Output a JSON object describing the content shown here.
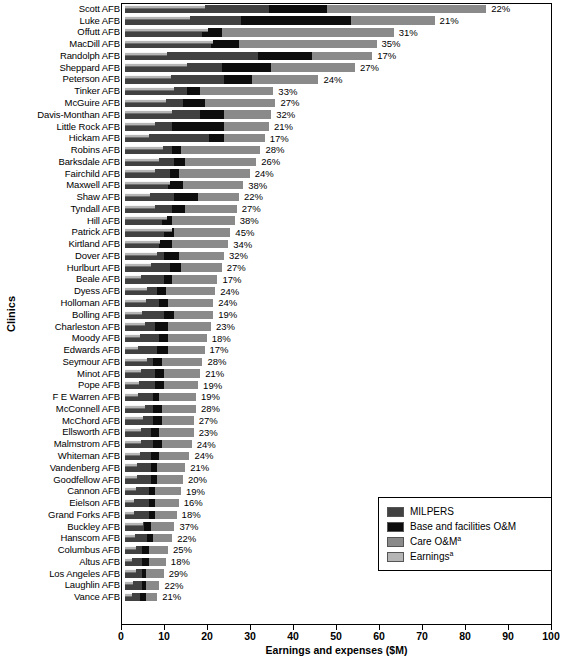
{
  "chart_data": {
    "type": "bar",
    "orientation": "horizontal",
    "stacked": true,
    "title": "",
    "xlabel": "Earnings and expenses ($M)",
    "ylabel": "Clinics",
    "xlim": [
      0,
      100
    ],
    "xticks": [
      0,
      10,
      20,
      30,
      40,
      50,
      60,
      70,
      80,
      90,
      100
    ],
    "grid": false,
    "legend_position": "lower-right",
    "legend": [
      {
        "name": "MILPERS",
        "color": "#414141"
      },
      {
        "name": "Base and facilities O&M",
        "color": "#0d0d0d"
      },
      {
        "name": "Care O&M",
        "superscript": "a",
        "color": "#8a8a8a"
      },
      {
        "name": "Earnings",
        "superscript": "a",
        "color": "#b5b5b5"
      }
    ],
    "series": [
      {
        "name": "MILPERS",
        "key": "milpers"
      },
      {
        "name": "Base and facilities O&M",
        "key": "bfom"
      },
      {
        "name": "Care O&M",
        "key": "care"
      },
      {
        "name": "Earnings",
        "key": "earnings"
      }
    ],
    "categories": [
      "Scott AFB",
      "Luke AFB",
      "Offutt AFB",
      "MacDill AFB",
      "Randolph AFB",
      "Sheppard AFB",
      "Peterson AFB",
      "Tinker AFB",
      "McGuire AFB",
      "Davis-Monthan AFB",
      "Little Rock AFB",
      "Hickam AFB",
      "Robins AFB",
      "Barksdale AFB",
      "Fairchild AFB",
      "Maxwell AFB",
      "Shaw AFB",
      "Tyndall AFB",
      "Hill AFB",
      "Patrick AFB",
      "Kirtland AFB",
      "Dover AFB",
      "Hurlburt AFB",
      "Beale AFB",
      "Dyess AFB",
      "Holloman AFB",
      "Bolling AFB",
      "Charleston AFB",
      "Moody AFB",
      "Edwards AFB",
      "Seymour AFB",
      "Minot AFB",
      "Pope AFB",
      "F E Warren AFB",
      "McConnell AFB",
      "McChord AFB",
      "Ellsworth AFB",
      "Malmstrom AFB",
      "Whiteman AFB",
      "Vandenberg AFB",
      "Goodfellow AFB",
      "Cannon AFB",
      "Eielson AFB",
      "Grand Forks AFB",
      "Buckley AFB",
      "Hanscom AFB",
      "Columbus AFB",
      "Altus AFB",
      "Los Angeles AFB",
      "Laughlin AFB",
      "Vance AFB"
    ],
    "rows": [
      {
        "clinic": "Scott AFB",
        "milpers": 33.5,
        "bfom": 13.5,
        "care": 37.0,
        "total": 84.0,
        "earnings": 18.5,
        "pct": "22%"
      },
      {
        "clinic": "Luke AFB",
        "milpers": 27.0,
        "bfom": 25.5,
        "care": 19.5,
        "total": 72.0,
        "earnings": 15.1,
        "pct": "21%"
      },
      {
        "clinic": "Offutt AFB",
        "milpers": 18.0,
        "bfom": 4.5,
        "care": 40.0,
        "total": 62.5,
        "earnings": 19.4,
        "pct": "31%"
      },
      {
        "clinic": "MacDill AFB",
        "milpers": 20.0,
        "bfom": 6.5,
        "care": 32.0,
        "total": 58.5,
        "earnings": 20.5,
        "pct": "35%"
      },
      {
        "clinic": "Randolph AFB",
        "milpers": 31.0,
        "bfom": 12.5,
        "care": 14.0,
        "total": 57.5,
        "earnings": 9.8,
        "pct": "17%"
      },
      {
        "clinic": "Sheppard AFB",
        "milpers": 22.5,
        "bfom": 11.5,
        "care": 19.5,
        "total": 53.5,
        "earnings": 14.4,
        "pct": "27%"
      },
      {
        "clinic": "Peterson AFB",
        "milpers": 23.0,
        "bfom": 6.5,
        "care": 15.5,
        "total": 45.0,
        "earnings": 10.8,
        "pct": "24%"
      },
      {
        "clinic": "Tinker AFB",
        "milpers": 14.5,
        "bfom": 3.0,
        "care": 17.0,
        "total": 34.5,
        "earnings": 11.4,
        "pct": "33%"
      },
      {
        "clinic": "McGuire AFB",
        "milpers": 13.5,
        "bfom": 5.0,
        "care": 16.5,
        "total": 35.0,
        "earnings": 9.5,
        "pct": "27%"
      },
      {
        "clinic": "Davis-Monthan AFB",
        "milpers": 17.5,
        "bfom": 5.5,
        "care": 11.0,
        "total": 34.0,
        "earnings": 10.9,
        "pct": "32%"
      },
      {
        "clinic": "Little Rock AFB",
        "milpers": 11.0,
        "bfom": 12.0,
        "care": 10.5,
        "total": 33.5,
        "earnings": 7.0,
        "pct": "21%"
      },
      {
        "clinic": "Hickam AFB",
        "milpers": 19.5,
        "bfom": 3.5,
        "care": 9.5,
        "total": 32.5,
        "earnings": 5.5,
        "pct": "17%"
      },
      {
        "clinic": "Robins AFB",
        "milpers": 11.0,
        "bfom": 2.0,
        "care": 18.5,
        "total": 31.5,
        "earnings": 8.8,
        "pct": "28%"
      },
      {
        "clinic": "Barksdale AFB",
        "milpers": 11.5,
        "bfom": 2.5,
        "care": 16.5,
        "total": 30.5,
        "earnings": 7.9,
        "pct": "26%"
      },
      {
        "clinic": "Fairchild AFB",
        "milpers": 10.5,
        "bfom": 2.0,
        "care": 16.5,
        "total": 29.0,
        "earnings": 7.0,
        "pct": "24%"
      },
      {
        "clinic": "Maxwell AFB",
        "milpers": 10.0,
        "bfom": 3.5,
        "care": 14.0,
        "total": 27.5,
        "earnings": 10.5,
        "pct": "38%"
      },
      {
        "clinic": "Shaw AFB",
        "milpers": 11.5,
        "bfom": 5.5,
        "care": 9.5,
        "total": 26.5,
        "earnings": 5.8,
        "pct": "22%"
      },
      {
        "clinic": "Tyndall AFB",
        "milpers": 11.0,
        "bfom": 3.0,
        "care": 12.0,
        "total": 26.0,
        "earnings": 7.0,
        "pct": "27%"
      },
      {
        "clinic": "Hill AFB",
        "milpers": 8.5,
        "bfom": 2.5,
        "care": 14.5,
        "total": 25.5,
        "earnings": 9.7,
        "pct": "38%"
      },
      {
        "clinic": "Patrick AFB",
        "milpers": 9.0,
        "bfom": 2.5,
        "care": 13.0,
        "total": 24.5,
        "earnings": 11.0,
        "pct": "45%"
      },
      {
        "clinic": "Kirtland AFB",
        "milpers": 8.0,
        "bfom": 3.0,
        "care": 13.0,
        "total": 24.0,
        "earnings": 8.2,
        "pct": "34%"
      },
      {
        "clinic": "Dover AFB",
        "milpers": 9.0,
        "bfom": 3.5,
        "care": 10.5,
        "total": 23.0,
        "earnings": 7.4,
        "pct": "32%"
      },
      {
        "clinic": "Hurlburt AFB",
        "milpers": 10.5,
        "bfom": 2.5,
        "care": 9.5,
        "total": 22.5,
        "earnings": 6.1,
        "pct": "27%"
      },
      {
        "clinic": "Beale AFB",
        "milpers": 9.0,
        "bfom": 2.0,
        "care": 10.5,
        "total": 21.5,
        "earnings": 3.7,
        "pct": "17%"
      },
      {
        "clinic": "Dyess AFB",
        "milpers": 7.5,
        "bfom": 2.0,
        "care": 11.5,
        "total": 21.0,
        "earnings": 5.0,
        "pct": "24%"
      },
      {
        "clinic": "Holloman AFB",
        "milpers": 8.0,
        "bfom": 2.0,
        "care": 10.5,
        "total": 20.5,
        "earnings": 4.9,
        "pct": "24%"
      },
      {
        "clinic": "Bolling AFB",
        "milpers": 9.0,
        "bfom": 2.5,
        "care": 9.0,
        "total": 20.5,
        "earnings": 3.9,
        "pct": "19%"
      },
      {
        "clinic": "Charleston AFB",
        "milpers": 7.0,
        "bfom": 3.0,
        "care": 10.0,
        "total": 20.0,
        "earnings": 4.6,
        "pct": "23%"
      },
      {
        "clinic": "Moody AFB",
        "milpers": 8.0,
        "bfom": 2.0,
        "care": 9.0,
        "total": 19.0,
        "earnings": 3.4,
        "pct": "18%"
      },
      {
        "clinic": "Edwards AFB",
        "milpers": 7.5,
        "bfom": 2.5,
        "care": 8.5,
        "total": 18.5,
        "earnings": 3.1,
        "pct": "17%"
      },
      {
        "clinic": "Seymour AFB",
        "milpers": 6.5,
        "bfom": 2.0,
        "care": 9.5,
        "total": 18.0,
        "earnings": 5.0,
        "pct": "28%"
      },
      {
        "clinic": "Minot AFB",
        "milpers": 7.0,
        "bfom": 2.0,
        "care": 8.5,
        "total": 17.5,
        "earnings": 3.7,
        "pct": "21%"
      },
      {
        "clinic": "Pope AFB",
        "milpers": 7.0,
        "bfom": 2.0,
        "care": 8.0,
        "total": 17.0,
        "earnings": 3.2,
        "pct": "19%"
      },
      {
        "clinic": "F E Warren AFB",
        "milpers": 6.5,
        "bfom": 1.5,
        "care": 8.5,
        "total": 16.5,
        "earnings": 3.1,
        "pct": "19%"
      },
      {
        "clinic": "McConnell AFB",
        "milpers": 6.5,
        "bfom": 2.0,
        "care": 8.0,
        "total": 16.5,
        "earnings": 4.6,
        "pct": "28%"
      },
      {
        "clinic": "McChord AFB",
        "milpers": 6.5,
        "bfom": 2.0,
        "care": 7.5,
        "total": 16.0,
        "earnings": 4.3,
        "pct": "27%"
      },
      {
        "clinic": "Ellsworth AFB",
        "milpers": 6.0,
        "bfom": 2.0,
        "care": 8.0,
        "total": 16.0,
        "earnings": 3.7,
        "pct": "23%"
      },
      {
        "clinic": "Malmstrom AFB",
        "milpers": 6.5,
        "bfom": 2.0,
        "care": 7.0,
        "total": 15.5,
        "earnings": 3.7,
        "pct": "24%"
      },
      {
        "clinic": "Whiteman AFB",
        "milpers": 6.0,
        "bfom": 2.0,
        "care": 7.0,
        "total": 15.0,
        "earnings": 3.6,
        "pct": "24%"
      },
      {
        "clinic": "Vandenberg AFB",
        "milpers": 6.0,
        "bfom": 1.5,
        "care": 6.5,
        "total": 14.0,
        "earnings": 2.9,
        "pct": "21%"
      },
      {
        "clinic": "Goodfellow AFB",
        "milpers": 6.0,
        "bfom": 1.5,
        "care": 6.0,
        "total": 13.5,
        "earnings": 2.7,
        "pct": "20%"
      },
      {
        "clinic": "Cannon AFB",
        "milpers": 5.5,
        "bfom": 1.5,
        "care": 6.0,
        "total": 13.0,
        "earnings": 2.5,
        "pct": "19%"
      },
      {
        "clinic": "Eielson AFB",
        "milpers": 5.5,
        "bfom": 1.5,
        "care": 5.5,
        "total": 12.5,
        "earnings": 2.0,
        "pct": "16%"
      },
      {
        "clinic": "Grand Forks AFB",
        "milpers": 5.5,
        "bfom": 1.5,
        "care": 5.0,
        "total": 12.0,
        "earnings": 2.2,
        "pct": "18%"
      },
      {
        "clinic": "Buckley AFB",
        "milpers": 4.5,
        "bfom": 1.5,
        "care": 5.5,
        "total": 11.5,
        "earnings": 4.3,
        "pct": "37%"
      },
      {
        "clinic": "Hanscom AFB",
        "milpers": 5.0,
        "bfom": 1.5,
        "care": 4.5,
        "total": 11.0,
        "earnings": 2.4,
        "pct": "22%"
      },
      {
        "clinic": "Columbus AFB",
        "milpers": 4.0,
        "bfom": 1.5,
        "care": 4.5,
        "total": 10.0,
        "earnings": 2.5,
        "pct": "25%"
      },
      {
        "clinic": "Altus AFB",
        "milpers": 4.0,
        "bfom": 1.5,
        "care": 4.0,
        "total": 9.5,
        "earnings": 1.7,
        "pct": "18%"
      },
      {
        "clinic": "Los Angeles AFB",
        "milpers": 4.0,
        "bfom": 1.0,
        "care": 4.0,
        "total": 9.0,
        "earnings": 2.6,
        "pct": "29%"
      },
      {
        "clinic": "Laughlin AFB",
        "milpers": 4.0,
        "bfom": 1.0,
        "care": 3.0,
        "total": 8.0,
        "earnings": 1.8,
        "pct": "22%"
      },
      {
        "clinic": "Vance AFB",
        "milpers": 3.5,
        "bfom": 1.5,
        "care": 2.5,
        "total": 7.5,
        "earnings": 1.6,
        "pct": "21%"
      }
    ]
  }
}
